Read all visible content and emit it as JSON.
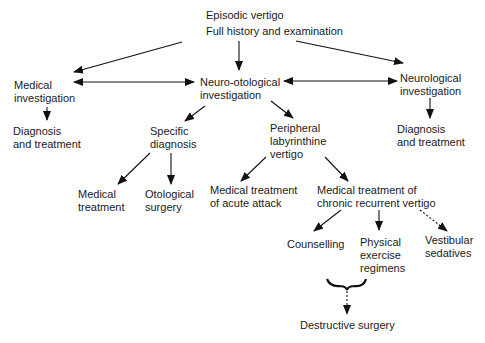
{
  "diagram": {
    "type": "flowchart",
    "nodes": {
      "root": {
        "lines": [
          "Episodic vertigo",
          "Full history and examination"
        ]
      },
      "medical_inv": {
        "lines": [
          "Medical",
          "investigation"
        ]
      },
      "neuro_oto": {
        "lines": [
          "Neuro-otological",
          "investigation"
        ]
      },
      "neurological": {
        "lines": [
          "Neurological",
          "investigation"
        ]
      },
      "diag_left": {
        "lines": [
          "Diagnosis",
          "and treatment"
        ]
      },
      "diag_right": {
        "lines": [
          "Diagnosis",
          "and treatment"
        ]
      },
      "specific": {
        "lines": [
          "Specific",
          "diagnosis"
        ]
      },
      "peripheral": {
        "lines": [
          "Peripheral",
          "labyrinthine",
          "vertigo"
        ]
      },
      "med_treat": {
        "lines": [
          "Medical",
          "treatment"
        ]
      },
      "oto_surgery": {
        "lines": [
          "Otological",
          "surgery"
        ]
      },
      "acute": {
        "lines": [
          "Medical treatment",
          "of acute attack"
        ]
      },
      "chronic": {
        "lines": [
          "Medical treatment of",
          "chronic recurrent vertigo"
        ]
      },
      "counselling": {
        "lines": [
          "Counselling"
        ]
      },
      "physical": {
        "lines": [
          "Physical",
          "exercise",
          "regimens"
        ]
      },
      "vestibular": {
        "lines": [
          "Vestibular",
          "sedatives"
        ]
      },
      "destructive": {
        "lines": [
          "Destructive surgery"
        ]
      }
    },
    "edges": [
      {
        "from": "root",
        "to": "medical_inv",
        "style": "solid"
      },
      {
        "from": "root",
        "to": "neuro_oto",
        "style": "solid"
      },
      {
        "from": "root",
        "to": "neurological",
        "style": "solid"
      },
      {
        "from": "medical_inv",
        "to": "neuro_oto",
        "style": "solid",
        "bidirectional": true
      },
      {
        "from": "neuro_oto",
        "to": "neurological",
        "style": "solid",
        "bidirectional": true
      },
      {
        "from": "medical_inv",
        "to": "diag_left",
        "style": "solid"
      },
      {
        "from": "neurological",
        "to": "diag_right",
        "style": "solid"
      },
      {
        "from": "neuro_oto",
        "to": "specific",
        "style": "solid"
      },
      {
        "from": "neuro_oto",
        "to": "peripheral",
        "style": "solid"
      },
      {
        "from": "specific",
        "to": "med_treat",
        "style": "solid"
      },
      {
        "from": "specific",
        "to": "oto_surgery",
        "style": "solid"
      },
      {
        "from": "peripheral",
        "to": "acute",
        "style": "solid"
      },
      {
        "from": "peripheral",
        "to": "chronic",
        "style": "solid"
      },
      {
        "from": "chronic",
        "to": "counselling",
        "style": "solid"
      },
      {
        "from": "chronic",
        "to": "physical",
        "style": "solid"
      },
      {
        "from": "chronic",
        "to": "vestibular",
        "style": "dotted"
      },
      {
        "from": [
          "counselling",
          "physical"
        ],
        "to": "destructive",
        "style": "dotted",
        "via": "brace"
      }
    ]
  }
}
